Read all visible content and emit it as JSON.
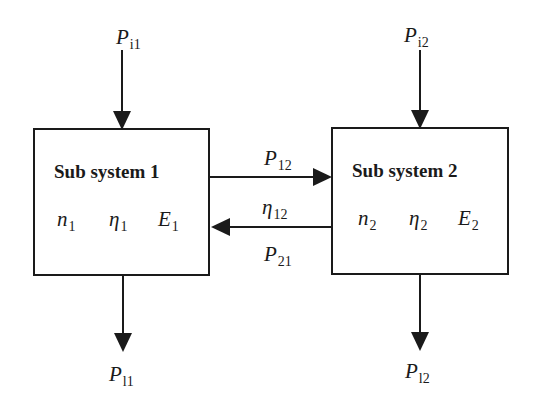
{
  "diagram": {
    "subsystems": [
      {
        "title": "Sub system 1",
        "params": [
          {
            "sym": "n",
            "sub": "1"
          },
          {
            "sym": "η",
            "sub": "1"
          },
          {
            "sym": "E",
            "sub": "1"
          }
        ],
        "input": {
          "sym": "P",
          "sub": "i1"
        },
        "loss": {
          "sym": "P",
          "sub": "l1"
        }
      },
      {
        "title": "Sub system 2",
        "params": [
          {
            "sym": "n",
            "sub": "2"
          },
          {
            "sym": "η",
            "sub": "2"
          },
          {
            "sym": "E",
            "sub": "2"
          }
        ],
        "input": {
          "sym": "P",
          "sub": "i2"
        },
        "loss": {
          "sym": "P",
          "sub": "l2"
        }
      }
    ],
    "links": [
      {
        "direction": "1→2",
        "label": {
          "sym": "P",
          "sub": "12"
        }
      },
      {
        "direction": "2→1",
        "label_above": {
          "sym": "η",
          "sub": "12"
        },
        "label_below": {
          "sym": "P",
          "sub": "21"
        }
      }
    ],
    "colors": {
      "line": "#1a1a1a",
      "background": "#ffffff"
    }
  }
}
